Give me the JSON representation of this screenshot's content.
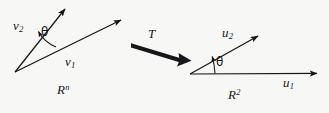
{
  "figure": {
    "background_color": "#f7f7f5",
    "ink_color": "#17171a",
    "width": 329,
    "height": 113,
    "domain_panel": {
      "space_label_base": "R",
      "space_label_exponent": "n",
      "space_label_text": "R",
      "angle_label": "θ",
      "vectors": [
        {
          "name": "v1",
          "base": "v",
          "subscript": "1",
          "from": [
            15,
            72
          ],
          "to": [
            125,
            18
          ]
        },
        {
          "name": "v2",
          "base": "v",
          "subscript": "2",
          "from": [
            15,
            72
          ],
          "to": [
            68,
            5
          ]
        }
      ]
    },
    "transform_arrow": {
      "label": "T",
      "from": [
        131,
        44
      ],
      "to": [
        188,
        62
      ]
    },
    "codomain_panel": {
      "space_label_base": "R",
      "space_label_exponent": "2",
      "space_label_text": "R",
      "angle_label": "θ",
      "vectors": [
        {
          "name": "u1",
          "base": "u",
          "subscript": "1",
          "from": [
            190,
            74
          ],
          "to": [
            322,
            73
          ]
        },
        {
          "name": "u2",
          "base": "u",
          "subscript": "2",
          "from": [
            190,
            74
          ],
          "to": [
            262,
            33
          ]
        }
      ]
    }
  }
}
